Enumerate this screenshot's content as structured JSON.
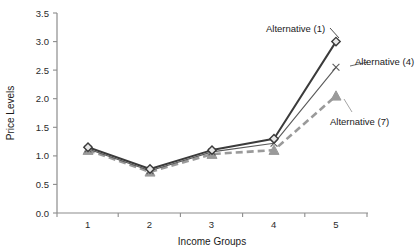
{
  "chart_data": {
    "type": "line",
    "title": "",
    "xlabel": "Income Groups",
    "ylabel": "Price Levels",
    "categories": [
      "1",
      "2",
      "3",
      "4",
      "5"
    ],
    "x": [
      1,
      2,
      3,
      4,
      5
    ],
    "xlim": [
      0.5,
      5.5
    ],
    "ylim": [
      0.0,
      3.5
    ],
    "yticks": [
      "0.0",
      "0.5",
      "1.0",
      "1.5",
      "2.0",
      "2.5",
      "3.0",
      "3.5"
    ],
    "ytick_values": [
      0.0,
      0.5,
      1.0,
      1.5,
      2.0,
      2.5,
      3.0,
      3.5
    ],
    "xticks": [
      "1",
      "2",
      "3",
      "4",
      "5"
    ],
    "grid": false,
    "legend": "none",
    "annotations": [
      {
        "text": "Alternative (1)",
        "series": "Alternative (1)"
      },
      {
        "text": "Alternative (4)",
        "series": "Alternative (4)"
      },
      {
        "text": "Alternative (7)",
        "series": "Alternative (7)"
      }
    ],
    "series": [
      {
        "name": "Alternative (1)",
        "values": [
          1.15,
          0.77,
          1.1,
          1.3,
          3.0
        ],
        "color": "#3b3b3b",
        "marker": "diamond",
        "linestyle": "solid"
      },
      {
        "name": "Alternative (4)",
        "values": [
          1.12,
          0.74,
          1.07,
          1.22,
          2.55
        ],
        "color": "#5a5a5a",
        "marker": "x",
        "linestyle": "solid"
      },
      {
        "name": "Alternative (7)",
        "values": [
          1.1,
          0.72,
          1.03,
          1.1,
          2.05
        ],
        "color": "#9a9a9a",
        "marker": "triangle",
        "linestyle": "dashed"
      }
    ]
  },
  "axis": {
    "x_title": "Income Groups",
    "y_title": "Price Levels"
  },
  "colors": {
    "axis": "#8c8c8c",
    "text": "#1a1a1a",
    "series_1": "#3b3b3b",
    "series_4": "#5a5a5a",
    "series_7": "#9a9a9a"
  }
}
